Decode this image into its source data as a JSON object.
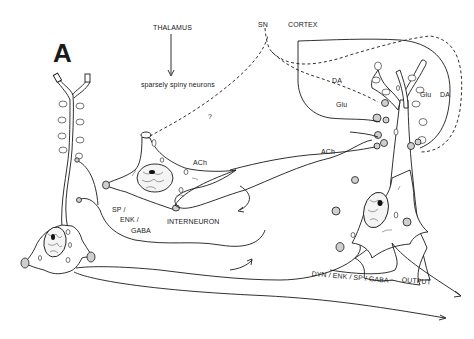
{
  "figure": {
    "panel_label": "A",
    "inputs": {
      "thalamus": "THALAMUS",
      "sparsely_spiny": "sparsely spiny neurons",
      "sn": "SN",
      "cortex": "CORTEX",
      "question": "?"
    },
    "transmitters": {
      "da_upper": "DA",
      "glu_upper": "Glu",
      "glu_right": "Glu",
      "da_right": "DA",
      "ach_interneuron": "ACh",
      "ach_axon": "ACh"
    },
    "cells": {
      "interneuron": "INTERNEURON",
      "collateral_sp": "SP /",
      "collateral_enk": "ENK /",
      "collateral_gaba": "GABA"
    },
    "output": {
      "axon_label": "DYN / ENK / SP / GABA",
      "output_label": "OUTPUT"
    }
  }
}
